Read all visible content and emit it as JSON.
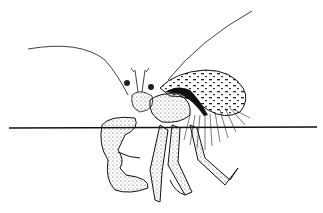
{
  "image": {
    "subject": "hermit crab line drawing",
    "style": "black ink stipple illustration on white",
    "colors": {
      "ink": "#111111",
      "background": "#ffffff"
    }
  }
}
